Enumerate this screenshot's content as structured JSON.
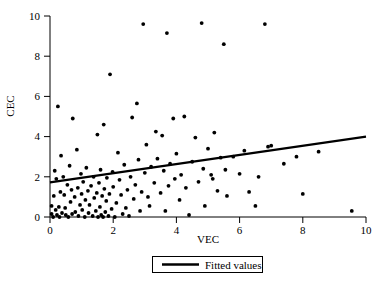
{
  "chart_data": {
    "type": "scatter",
    "title": "",
    "xlabel": "VEC",
    "ylabel": "CEC",
    "xlim": [
      0,
      10
    ],
    "ylim": [
      0,
      10
    ],
    "xticks": [
      0,
      2,
      4,
      6,
      8,
      10
    ],
    "yticks": [
      0,
      2,
      4,
      6,
      8,
      10
    ],
    "xtick_labels": [
      "0",
      "2",
      "4",
      "6",
      "8",
      "10"
    ],
    "ytick_labels": [
      "0",
      "2",
      "4",
      "6",
      "8",
      "10"
    ],
    "grid": false,
    "legend_position": "below-axes-center",
    "legend": [
      {
        "label": "Fitted values",
        "marker": "line",
        "color": "#000000"
      }
    ],
    "series": [
      {
        "name": "observations",
        "type": "scatter",
        "marker": "filled-circle",
        "color": "#000000",
        "points": [
          [
            0.05,
            0.55
          ],
          [
            0.05,
            0.15
          ],
          [
            0.1,
            0.0
          ],
          [
            0.12,
            1.05
          ],
          [
            0.15,
            2.3
          ],
          [
            0.18,
            0.35
          ],
          [
            0.2,
            1.9
          ],
          [
            0.22,
            0.1
          ],
          [
            0.25,
            5.5
          ],
          [
            0.28,
            0.5
          ],
          [
            0.3,
            0.0
          ],
          [
            0.33,
            1.25
          ],
          [
            0.35,
            3.05
          ],
          [
            0.38,
            0.2
          ],
          [
            0.42,
            2.0
          ],
          [
            0.45,
            1.1
          ],
          [
            0.48,
            0.45
          ],
          [
            0.5,
            0.1
          ],
          [
            0.55,
            1.6
          ],
          [
            0.58,
            0.0
          ],
          [
            0.62,
            2.55
          ],
          [
            0.65,
            0.75
          ],
          [
            0.68,
            1.35
          ],
          [
            0.7,
            0.15
          ],
          [
            0.72,
            4.9
          ],
          [
            0.78,
            1.0
          ],
          [
            0.8,
            0.25
          ],
          [
            0.85,
            3.35
          ],
          [
            0.88,
            1.45
          ],
          [
            0.9,
            0.05
          ],
          [
            0.95,
            0.6
          ],
          [
            0.98,
            2.15
          ],
          [
            1.0,
            1.15
          ],
          [
            1.02,
            0.35
          ],
          [
            1.05,
            1.75
          ],
          [
            1.1,
            0.0
          ],
          [
            1.12,
            0.85
          ],
          [
            1.15,
            2.45
          ],
          [
            1.2,
            1.3
          ],
          [
            1.22,
            0.2
          ],
          [
            1.25,
            0.6
          ],
          [
            1.3,
            1.55
          ],
          [
            1.35,
            0.05
          ],
          [
            1.38,
            2.0
          ],
          [
            1.4,
            0.95
          ],
          [
            1.45,
            0.3
          ],
          [
            1.48,
            1.2
          ],
          [
            1.5,
            4.1
          ],
          [
            1.52,
            0.0
          ],
          [
            1.55,
            1.7
          ],
          [
            1.58,
            0.5
          ],
          [
            1.6,
            2.35
          ],
          [
            1.62,
            0.1
          ],
          [
            1.65,
            1.05
          ],
          [
            1.68,
            0.0
          ],
          [
            1.7,
            4.6
          ],
          [
            1.72,
            1.4
          ],
          [
            1.75,
            0.25
          ],
          [
            1.78,
            0.8
          ],
          [
            1.8,
            1.95
          ],
          [
            1.85,
            0.05
          ],
          [
            1.88,
            1.15
          ],
          [
            1.9,
            7.1
          ],
          [
            1.95,
            0.4
          ],
          [
            1.98,
            2.25
          ],
          [
            2.0,
            1.5
          ],
          [
            2.05,
            0.0
          ],
          [
            2.1,
            0.7
          ],
          [
            2.15,
            3.2
          ],
          [
            2.2,
            1.85
          ],
          [
            2.25,
            1.1
          ],
          [
            2.3,
            0.15
          ],
          [
            2.35,
            2.6
          ],
          [
            2.4,
            0.45
          ],
          [
            2.45,
            1.35
          ],
          [
            2.5,
            0.05
          ],
          [
            2.55,
            2.0
          ],
          [
            2.6,
            4.95
          ],
          [
            2.65,
            0.9
          ],
          [
            2.7,
            1.6
          ],
          [
            2.75,
            5.65
          ],
          [
            2.8,
            2.85
          ],
          [
            2.85,
            0.3
          ],
          [
            2.9,
            1.25
          ],
          [
            2.95,
            9.6
          ],
          [
            3.0,
            2.2
          ],
          [
            3.05,
            3.6
          ],
          [
            3.1,
            1.0
          ],
          [
            3.15,
            0.55
          ],
          [
            3.2,
            2.5
          ],
          [
            3.3,
            1.7
          ],
          [
            3.35,
            4.25
          ],
          [
            3.4,
            2.9
          ],
          [
            3.5,
            1.2
          ],
          [
            3.55,
            4.05
          ],
          [
            3.6,
            2.3
          ],
          [
            3.65,
            0.3
          ],
          [
            3.7,
            9.15
          ],
          [
            3.75,
            1.55
          ],
          [
            3.8,
            2.65
          ],
          [
            3.9,
            4.9
          ],
          [
            3.95,
            1.9
          ],
          [
            4.0,
            3.15
          ],
          [
            4.1,
            0.85
          ],
          [
            4.15,
            2.1
          ],
          [
            4.25,
            5.0
          ],
          [
            4.3,
            1.45
          ],
          [
            4.4,
            0.1
          ],
          [
            4.5,
            2.75
          ],
          [
            4.6,
            3.95
          ],
          [
            4.7,
            1.75
          ],
          [
            4.8,
            9.65
          ],
          [
            4.85,
            2.4
          ],
          [
            4.9,
            0.55
          ],
          [
            5.0,
            3.4
          ],
          [
            5.1,
            2.1
          ],
          [
            5.15,
            1.9
          ],
          [
            5.2,
            4.2
          ],
          [
            5.3,
            1.3
          ],
          [
            5.4,
            2.95
          ],
          [
            5.5,
            8.6
          ],
          [
            5.55,
            2.35
          ],
          [
            5.6,
            1.05
          ],
          [
            5.8,
            3.0
          ],
          [
            6.0,
            2.15
          ],
          [
            6.15,
            3.3
          ],
          [
            6.3,
            1.25
          ],
          [
            6.5,
            0.55
          ],
          [
            6.6,
            2.0
          ],
          [
            6.8,
            9.6
          ],
          [
            6.9,
            3.5
          ],
          [
            7.0,
            3.55
          ],
          [
            7.4,
            2.65
          ],
          [
            7.8,
            3.0
          ],
          [
            8.0,
            1.15
          ],
          [
            8.5,
            3.25
          ],
          [
            9.55,
            0.3
          ]
        ]
      },
      {
        "name": "Fitted values",
        "type": "line",
        "color": "#000000",
        "x": [
          0,
          10
        ],
        "y": [
          1.72,
          4.0
        ],
        "slope": 0.228,
        "intercept": 1.72
      }
    ]
  },
  "figure": {
    "x_axis_title": "VEC",
    "y_axis_title": "CEC",
    "legend_label": "Fitted values",
    "background": "#ffffff",
    "foreground": "#000000"
  }
}
